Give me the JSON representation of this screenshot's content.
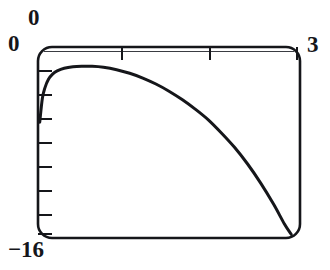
{
  "chart_data": {
    "type": "line",
    "title": "",
    "subtitle": "",
    "xlabel": "",
    "ylabel": "",
    "xlim": [
      0,
      3
    ],
    "ylim": [
      -16,
      0
    ],
    "grid": false,
    "legend": null,
    "frame": "rounded-rectangle box with tick marks on top and left edges",
    "axis_labels": {
      "x_min": "0",
      "x_max": "3",
      "y_min": "-16",
      "y_max": "0"
    },
    "x_ticks": [
      1,
      2
    ],
    "y_ticks": [
      -2,
      -4,
      -6,
      -8,
      -10,
      -12,
      -14,
      -16
    ],
    "series": [
      {
        "name": "curve",
        "x": [
          0.02,
          0.05,
          0.08,
          0.12,
          0.17,
          0.22,
          0.3,
          0.4,
          0.5,
          0.62,
          0.75,
          0.9,
          1.05,
          1.2,
          1.35,
          1.5,
          1.65,
          1.8,
          1.95,
          2.1,
          2.25,
          2.4,
          2.55,
          2.7,
          2.82,
          2.9
        ],
        "y": [
          -6.3,
          -4.3,
          -3.4,
          -2.7,
          -2.25,
          -2.0,
          -1.78,
          -1.66,
          -1.62,
          -1.62,
          -1.7,
          -1.9,
          -2.2,
          -2.6,
          -3.1,
          -3.7,
          -4.4,
          -5.2,
          -6.1,
          -7.2,
          -8.4,
          -9.8,
          -11.4,
          -13.2,
          -14.8,
          -15.7
        ]
      }
    ]
  },
  "labels": {
    "y_max": "0",
    "x_min": "0",
    "x_max": "3",
    "y_min": "−16"
  }
}
